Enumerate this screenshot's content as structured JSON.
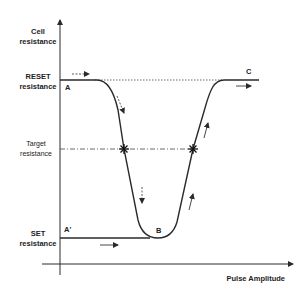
{
  "diagram": {
    "y_axis_label_line1": "Cell",
    "y_axis_label_line2": "resistance",
    "x_axis_label": "Pulse Amplitude",
    "levels": {
      "reset_line1": "RESET",
      "reset_line2": "resistance",
      "target_line1": "Target",
      "target_line2": "resistance",
      "set_line1": "SET",
      "set_line2": "resistance"
    },
    "points": {
      "A": "A",
      "A_prime": "A'",
      "B": "B",
      "C": "C"
    },
    "colors": {
      "line": "#2a2a2a",
      "text": "#222222",
      "background": "#ffffff"
    }
  }
}
